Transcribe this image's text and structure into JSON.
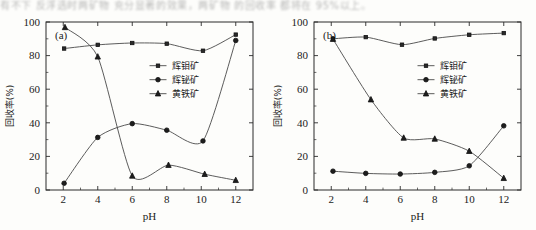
{
  "top_fragment": {
    "text": "有不下 反浮选时两矿物 充分显著的效果，两矿物 的回收率 都将在 95%以上。"
  },
  "axes": {
    "x_label": "pH",
    "y_label": "回收率(%)",
    "x_ticks": [
      "2",
      "4",
      "6",
      "8",
      "10",
      "12"
    ],
    "y_ticks": [
      "0",
      "20",
      "40",
      "60",
      "80",
      "100"
    ],
    "x_range": [
      1,
      13
    ],
    "y_range": [
      0,
      100
    ]
  },
  "legend": {
    "series": [
      {
        "label": "辉钼矿",
        "marker": "square"
      },
      {
        "label": "辉铋矿",
        "marker": "circle"
      },
      {
        "label": "黄铁矿",
        "marker": "triangle"
      }
    ]
  },
  "chart_data": [
    {
      "type": "line",
      "panel": "(a)",
      "title": "",
      "xlabel": "pH",
      "ylabel": "回收率(%)",
      "xlim": [
        1,
        13
      ],
      "ylim": [
        0,
        100
      ],
      "grid": false,
      "legend_position": "center-right",
      "x": [
        2,
        4,
        6,
        8,
        10,
        12
      ],
      "series": [
        {
          "name": "辉钼矿",
          "marker": "square",
          "x": [
            2.05,
            4.0,
            6.0,
            8.0,
            10.1,
            12.0
          ],
          "values": [
            84.2,
            86.4,
            87.5,
            87.1,
            82.9,
            92.5
          ]
        },
        {
          "name": "辉铋矿",
          "marker": "circle",
          "x": [
            2.05,
            4.0,
            6.0,
            8.0,
            10.1,
            12.0
          ],
          "values": [
            4.0,
            31.3,
            39.5,
            35.6,
            29.2,
            89.0
          ]
        },
        {
          "name": "黄铁矿",
          "marker": "triangle",
          "x": [
            2.1,
            4.0,
            6.0,
            8.1,
            10.2,
            12.0
          ],
          "values": [
            96.8,
            79.3,
            8.4,
            14.8,
            9.4,
            5.8
          ]
        }
      ]
    },
    {
      "type": "line",
      "panel": "(b)",
      "title": "",
      "xlabel": "pH",
      "ylabel": "回收率(%)",
      "xlim": [
        1,
        13
      ],
      "ylim": [
        0,
        100
      ],
      "grid": false,
      "legend_position": "center-right",
      "x": [
        2,
        4,
        6,
        8,
        10,
        12
      ],
      "series": [
        {
          "name": "辉钼矿",
          "marker": "square",
          "x": [
            2.1,
            4.0,
            6.1,
            8.0,
            10.0,
            12.0
          ],
          "values": [
            90.0,
            91.0,
            86.5,
            90.2,
            92.4,
            93.4
          ]
        },
        {
          "name": "辉铋矿",
          "marker": "circle",
          "x": [
            2.1,
            4.0,
            6.0,
            8.0,
            10.0,
            12.0
          ],
          "values": [
            11.2,
            9.9,
            9.5,
            10.5,
            14.4,
            38.2
          ]
        },
        {
          "name": "黄铁矿",
          "marker": "triangle",
          "x": [
            2.1,
            4.3,
            6.2,
            8.0,
            10.0,
            12.0
          ],
          "values": [
            89.8,
            53.8,
            31.0,
            30.4,
            23.1,
            7.0
          ]
        }
      ]
    }
  ]
}
